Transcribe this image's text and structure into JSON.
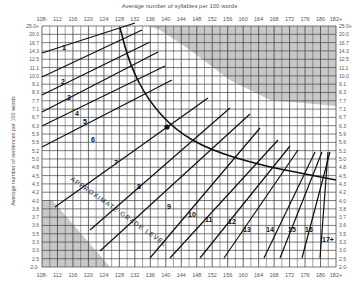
{
  "chart_data": {
    "type": "line",
    "title": "Average number of syllables per 100 words",
    "xlabel": "Average number of syllables per 100 words",
    "ylabel": "Average number of sentences per 100 words",
    "x_ticks": [
      "108-",
      "112",
      "116",
      "120",
      "124",
      "128",
      "132",
      "136",
      "140",
      "144",
      "148",
      "152",
      "156",
      "160",
      "164",
      "168",
      "172",
      "176",
      "180",
      "182+"
    ],
    "y_ticks": [
      "25.0+",
      "20.0",
      "16.7",
      "14.3",
      "12.5",
      "11.1",
      "10.0",
      "9.1",
      "8.3",
      "7.7",
      "7.1",
      "6.7",
      "6.3",
      "5.9",
      "5.6",
      "5.2",
      "5.0",
      "4.8",
      "4.5",
      "4.3",
      "4.2",
      "4.0",
      "3.8",
      "3.7",
      "3.6",
      "3.5",
      "3.3",
      "3.0",
      "2.5",
      "2.0-"
    ],
    "curve_label": "APPROXIMATE GRADE LEVEL",
    "grade_labels": [
      {
        "text": "1",
        "x": 62,
        "y": 50
      },
      {
        "text": "2",
        "x": 61,
        "y": 84
      },
      {
        "text": "3",
        "x": 67,
        "y": 100
      },
      {
        "text": "4",
        "x": 75,
        "y": 116
      },
      {
        "text": "5",
        "x": 83,
        "y": 124
      },
      {
        "text": "6",
        "x": 91,
        "y": 142
      },
      {
        "text": "7",
        "x": 114,
        "y": 165
      },
      {
        "text": "8",
        "x": 137,
        "y": 189
      },
      {
        "text": "9",
        "x": 167,
        "y": 209
      },
      {
        "text": "10",
        "x": 188,
        "y": 217
      },
      {
        "text": "11",
        "x": 205,
        "y": 222
      },
      {
        "text": "12",
        "x": 228,
        "y": 224
      },
      {
        "text": "13",
        "x": 243,
        "y": 232
      },
      {
        "text": "14",
        "x": 266,
        "y": 232
      },
      {
        "text": "15",
        "x": 288,
        "y": 232
      },
      {
        "text": "16",
        "x": 305,
        "y": 232
      },
      {
        "text": "17+",
        "x": 322,
        "y": 242
      }
    ],
    "grade_lines": [
      [
        [
          42,
          53
        ],
        [
          135,
          23
        ]
      ],
      [
        [
          42,
          77
        ],
        [
          142,
          30
        ]
      ],
      [
        [
          42,
          95
        ],
        [
          150,
          42
        ]
      ],
      [
        [
          42,
          112
        ],
        [
          158,
          52
        ]
      ],
      [
        [
          42,
          126
        ],
        [
          165,
          66
        ]
      ],
      [
        [
          42,
          147
        ],
        [
          172,
          80
        ]
      ],
      [
        [
          55,
          207
        ],
        [
          208,
          98
        ]
      ],
      [
        [
          90,
          230
        ],
        [
          230,
          108
        ]
      ],
      [
        [
          100,
          251
        ],
        [
          250,
          114
        ]
      ],
      [
        [
          150,
          258
        ],
        [
          260,
          128
        ]
      ],
      [
        [
          170,
          258
        ],
        [
          278,
          140
        ]
      ],
      [
        [
          200,
          258
        ],
        [
          290,
          146
        ]
      ],
      [
        [
          224,
          258
        ],
        [
          298,
          150
        ]
      ],
      [
        [
          264,
          258
        ],
        [
          315,
          152
        ]
      ],
      [
        [
          280,
          258
        ],
        [
          322,
          152
        ]
      ],
      [
        [
          302,
          258
        ],
        [
          330,
          152
        ]
      ],
      [
        [
          320,
          258
        ],
        [
          328,
          152
        ]
      ]
    ],
    "boundary_curve": [
      [
        120,
        28
      ],
      [
        130,
        65
      ],
      [
        148,
        100
      ],
      [
        175,
        130
      ],
      [
        210,
        150
      ],
      [
        260,
        165
      ],
      [
        300,
        173
      ],
      [
        336,
        180
      ]
    ],
    "shaded_regions": [
      {
        "name": "invalid-top-right",
        "points": [
          [
            148,
            26
          ],
          [
            336,
            26
          ],
          [
            336,
            106
          ],
          [
            270,
            100
          ],
          [
            230,
            80
          ],
          [
            190,
            50
          ],
          [
            160,
            30
          ]
        ]
      },
      {
        "name": "invalid-bottom-left",
        "points": [
          [
            42,
            200
          ],
          [
            52,
            200
          ],
          [
            110,
            267
          ],
          [
            42,
            267
          ]
        ]
      }
    ],
    "sample_point": {
      "x": 167,
      "y": 127
    },
    "grid": true,
    "accent_color": "#111111",
    "grid_color": "#444444",
    "shade_color": "#c8c8c8"
  }
}
